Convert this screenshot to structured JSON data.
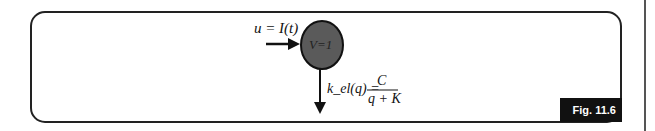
{
  "diagram": {
    "input_label": "u = I(t)",
    "compartment_label": "V=1",
    "elimination_label_lhs": "k_el(q) =",
    "fraction_numerator": "C",
    "fraction_denominator": "q + K",
    "figure_tag": "Fig. 11.6",
    "colors": {
      "compartment_fill": "#5a5a5a",
      "border": "#222222",
      "tag_bg": "#111111"
    }
  }
}
